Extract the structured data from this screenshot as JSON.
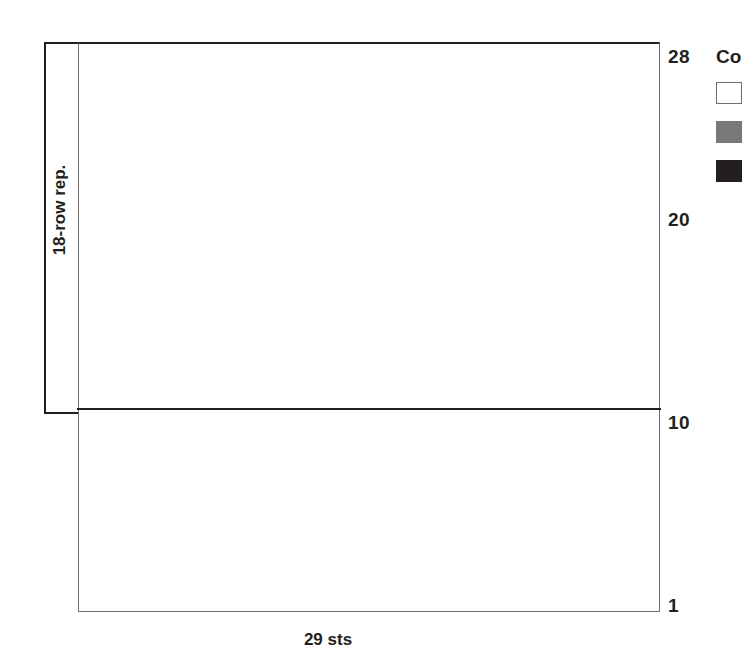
{
  "chart_data": {
    "type": "heatmap",
    "title": "",
    "xlabel": "29 sts",
    "ylabel": "",
    "grid": true,
    "columns": 29,
    "rows": 28,
    "legend_position": "right",
    "palette": {
      "white": "#ffffff",
      "gray": "#76787a",
      "black": "#231f20"
    },
    "row_tick_labels": [
      "28",
      "20",
      "10",
      "1"
    ],
    "row_ticks": [
      28,
      20,
      10,
      1
    ],
    "x_tick_labels": [],
    "repeat_line_after_row": 10,
    "annotations": [
      "18-row rep.",
      "29 sts"
    ],
    "legend_entries": [
      {
        "swatch": "white",
        "label": ""
      },
      {
        "swatch": "gray",
        "label": ""
      },
      {
        "swatch": "black",
        "label": ""
      }
    ],
    "cell_codes": {
      "w": "white",
      "g": "gray",
      "k": "black"
    },
    "rows_data": [
      {
        "row": 28,
        "cells": "wwwwwgwgwwwwwwwgwgwwwwwwwgwgw"
      },
      {
        "row": 27,
        "cells": "wwwwwwgwgwwwwgwgwgwwwwgwgwwww"
      },
      {
        "row": 26,
        "cells": "wwwwwwwgwgwgwgwgwgwgwgwgwwwww"
      },
      {
        "row": 25,
        "cells": "wwwwwwwwgwgwgwwwwwgwgwgwwwwww"
      },
      {
        "row": 24,
        "cells": "wwwwwwwwwgwgwwwwwgwgwgwwwwwww"
      },
      {
        "row": 23,
        "cells": "wwwwwwwwgwgwgwwwwwgwgwwwwwwww"
      },
      {
        "row": 22,
        "cells": "wwwwwwwgwgwgwgwwgwgwwwwwwwwww"
      },
      {
        "row": 21,
        "cells": "wwwwwwgwgwwwwgwgwgwwwwwwwwwww"
      },
      {
        "row": 20,
        "cells": "wwwwwgwgwwwwgwgwwwwwwwwwwwwww"
      },
      {
        "row": 19,
        "cells": "wwwkkwwwwkkwwgwwwwwwwgwwwwwww"
      },
      {
        "row": 18,
        "cells": "wwkkkkwkkkkkwwwwwwwwwwgwgwwww"
      },
      {
        "row": 17,
        "cells": "wwkkkkwkkkkkwwwwwwwwgwgwgwwww"
      },
      {
        "row": 16,
        "cells": "wwwkkwkwkkkwwwwwwwwgwgwgwgwww"
      },
      {
        "row": 15,
        "cells": "wwwwkkkkkwwwwwwwwwwwgwgwgwgww"
      },
      {
        "row": 14,
        "cells": "wwwkkwkwkkkwwwwwwwwwwgwgwgwgw"
      },
      {
        "row": 13,
        "cells": "wwkkkkwkkkkkwwwwwwwwwwgwgwgww"
      },
      {
        "row": 12,
        "cells": "wwkkkkwkkkkkwwwwwwwwwwwgwgwww"
      },
      {
        "row": 11,
        "cells": "wwwkkwwwwkkwwwwgwwwwwwgwgwwww"
      },
      {
        "row": 10,
        "cells": "wwwwwgwgwwwwwwwgwgwwwwwgwgwww"
      },
      {
        "row": 9,
        "cells": "wwwwwwgwgwwwwgwgwgwwwwgwgwwww"
      },
      {
        "row": 8,
        "cells": "wwwwwwwgwgwgwgwgwgwgwgwwwwwww"
      },
      {
        "row": 7,
        "cells": "wwwwwwwwgwgwgwwwwwgwgwgwwwwww"
      },
      {
        "row": 6,
        "cells": "wwwwwwwwwgwgwwwwwwgwgwgwwwwww"
      },
      {
        "row": 5,
        "cells": "wwwwwwwwwwgwgwgwgwgwgwgwwwwww"
      },
      {
        "row": 4,
        "cells": "wwwwwwwwwwwgwgwgwgwgwgwgwwwww"
      },
      {
        "row": 3,
        "cells": "wwwwwwwwwwwwgwgwgwgwwgwgwwwww"
      },
      {
        "row": 2,
        "cells": "wwwwwwwwwwwwwgwgwwwwwwgwgwwww"
      },
      {
        "row": 1,
        "cells": "wwwwwwwwwwwwwwgwwwwwwwgwgwwww"
      }
    ]
  },
  "labels": {
    "sts_label": "29 sts",
    "repeat_label": "18-row rep.",
    "row_28": "28",
    "row_20": "20",
    "row_10": "10",
    "row_1": "1"
  },
  "legend": {
    "title": "Co",
    "entries": [
      {
        "swatch": "white",
        "label": ""
      },
      {
        "swatch": "gray",
        "label": ""
      },
      {
        "swatch": "black",
        "label": ""
      }
    ]
  }
}
